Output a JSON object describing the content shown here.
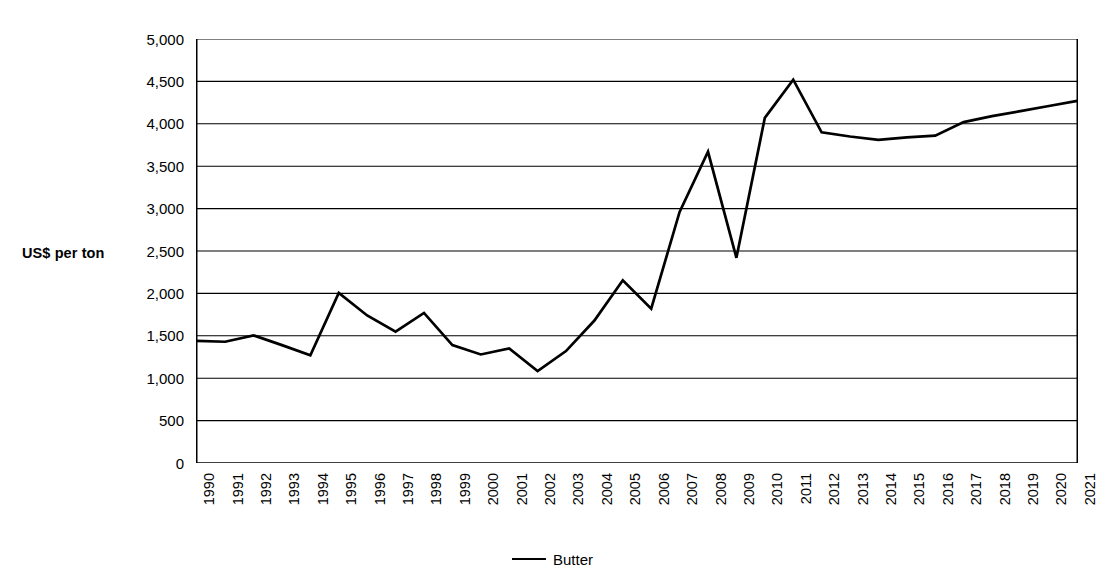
{
  "chart_data": {
    "type": "line",
    "title": "",
    "xlabel": "",
    "ylabel": "US$ per ton",
    "ylim": [
      0,
      5000
    ],
    "ytick_step": 500,
    "grid": true,
    "legend_position": "bottom",
    "line_color": "#000000",
    "categories": [
      "1990",
      "1991",
      "1992",
      "1993",
      "1994",
      "1995",
      "1996",
      "1997",
      "1998",
      "1999",
      "2000",
      "2001",
      "2002",
      "2003",
      "2004",
      "2005",
      "2006",
      "2007",
      "2008",
      "2009",
      "2010",
      "2011",
      "2012",
      "2013",
      "2014",
      "2015",
      "2016",
      "2017",
      "2018",
      "2019",
      "2020",
      "2021"
    ],
    "ytick_labels": [
      "0",
      "500",
      "1,000",
      "1,500",
      "2,000",
      "2,500",
      "3,000",
      "3,500",
      "4,000",
      "4,500",
      "5,000"
    ],
    "ytick_values": [
      0,
      500,
      1000,
      1500,
      2000,
      2500,
      3000,
      3500,
      4000,
      4500,
      5000
    ],
    "series": [
      {
        "name": "Butter",
        "values": [
          1440,
          1430,
          1505,
          1390,
          1270,
          2005,
          1740,
          1550,
          1770,
          1390,
          1280,
          1350,
          1085,
          1320,
          1680,
          2155,
          1820,
          2960,
          3670,
          2420,
          4070,
          4520,
          3900,
          3850,
          3810,
          3840,
          3860,
          4020,
          4090,
          4150,
          4210,
          4270
        ]
      }
    ],
    "legend": [
      {
        "label": "Butter",
        "color": "#000000",
        "marker": "line"
      }
    ]
  }
}
